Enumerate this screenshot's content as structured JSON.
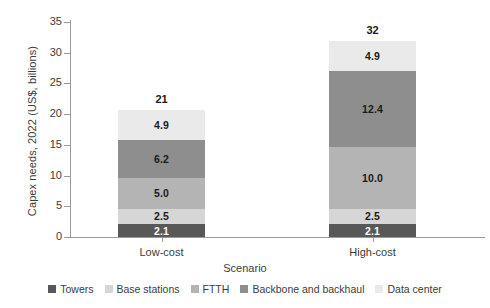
{
  "chart_data": {
    "type": "bar",
    "subtype": "stacked-vertical",
    "title": "",
    "xlabel": "Scenario",
    "ylabel": "Capex needs, 2022 (US$, billions)",
    "ylim": [
      0,
      35
    ],
    "yticks": [
      0,
      5,
      10,
      15,
      20,
      25,
      30,
      35
    ],
    "ytick_labels": [
      "0",
      "5",
      "10",
      "15",
      "20",
      "25",
      "30",
      "35"
    ],
    "grid": false,
    "legend_position": "bottom",
    "categories": [
      "Low-cost",
      "High-cost"
    ],
    "series": [
      {
        "name": "Towers",
        "color": "#585858",
        "values": [
          2.1,
          2.1
        ],
        "labels": [
          "2.1",
          "2.1"
        ],
        "label_color": "light"
      },
      {
        "name": "Base stations",
        "color": "#d6d6d6",
        "values": [
          2.5,
          2.5
        ],
        "labels": [
          "2.5",
          "2.5"
        ],
        "label_color": "dark"
      },
      {
        "name": "FTTH",
        "color": "#b4b4b4",
        "values": [
          5.0,
          10.0
        ],
        "labels": [
          "5.0",
          "10.0"
        ],
        "label_color": "dark"
      },
      {
        "name": "Backbone and backhaul",
        "color": "#8e8e8e",
        "values": [
          6.2,
          12.4
        ],
        "labels": [
          "6.2",
          "12.4"
        ],
        "label_color": "dark"
      },
      {
        "name": "Data center",
        "color": "#eaeaea",
        "values": [
          4.9,
          4.9
        ],
        "labels": [
          "4.9",
          "4.9"
        ],
        "label_color": "dark"
      }
    ],
    "totals": [
      21,
      32
    ],
    "total_labels": [
      "21",
      "32"
    ]
  }
}
